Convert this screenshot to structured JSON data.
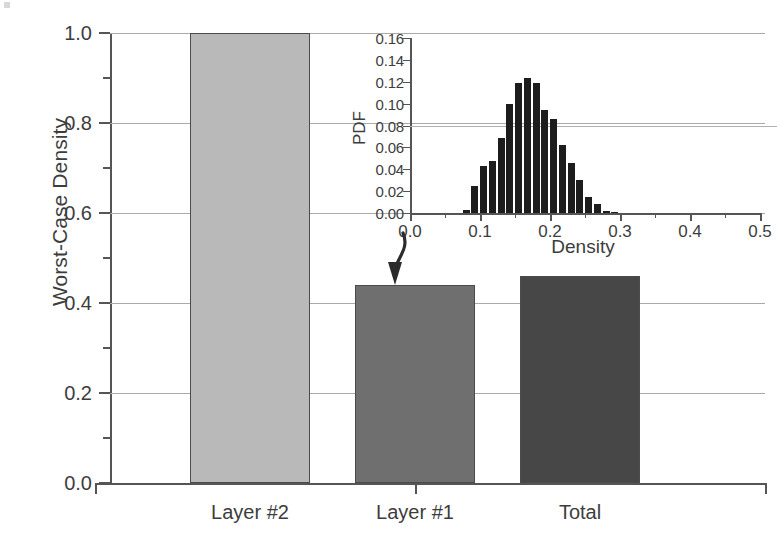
{
  "chart_data": {
    "type": "bar",
    "title": "",
    "xlabel": "",
    "ylabel": "Worst-Case Density",
    "categories": [
      "Layer #2",
      "Layer #1",
      "Total"
    ],
    "values": [
      1.0,
      0.44,
      0.46
    ],
    "ylim": [
      0.0,
      1.0
    ],
    "ytick_labels": [
      "0.0",
      "0.2",
      "0.4",
      "0.6",
      "0.8",
      "1.0"
    ],
    "ytick_values": [
      0.0,
      0.2,
      0.4,
      0.6,
      0.8,
      1.0
    ],
    "yminor_values": [
      0.1,
      0.3,
      0.5,
      0.7,
      0.9
    ],
    "grid": "horizontal",
    "legend": "none",
    "bar_colors": [
      "#b9b9b9",
      "#6f6f6f",
      "#474747"
    ],
    "bar_edge_color": "#4b4b4b",
    "annotation": {
      "type": "curved-arrow",
      "from": "inset-histogram",
      "to": "Layer #1 bar top"
    }
  },
  "inset_chart_data": {
    "type": "bar",
    "subtype": "histogram",
    "title": "",
    "xlabel": "Density",
    "ylabel": "PDF",
    "ylim": [
      0.0,
      0.16
    ],
    "xlim": [
      0.0,
      0.5
    ],
    "ytick_labels": [
      "0.00",
      "0.02",
      "0.04",
      "0.06",
      "0.08",
      "0.10",
      "0.12",
      "0.14",
      "0.16"
    ],
    "ytick_values": [
      0.0,
      0.02,
      0.04,
      0.06,
      0.08,
      0.1,
      0.12,
      0.14,
      0.16
    ],
    "xtick_labels": [
      "0.0",
      "0.1",
      "0.2",
      "0.3",
      "0.4",
      "0.5"
    ],
    "xtick_values": [
      0.0,
      0.1,
      0.2,
      0.3,
      0.4,
      0.5
    ],
    "grid": "horizontal",
    "bar_color": "#1d1d1d",
    "bin_width": 0.0125,
    "bin_centers": [
      0.06875,
      0.08125,
      0.09375,
      0.10625,
      0.11875,
      0.13125,
      0.14375,
      0.15625,
      0.16875,
      0.18125,
      0.19375,
      0.20625,
      0.21875,
      0.23125,
      0.24375,
      0.25625,
      0.26875,
      0.28125,
      0.29375,
      0.30625,
      0.31875,
      0.33125,
      0.34375,
      0.35625,
      0.36875,
      0.38125,
      0.39375
    ],
    "values": [
      0.0,
      0.003,
      0.025,
      0.043,
      0.048,
      0.069,
      0.1,
      0.119,
      0.123,
      0.119,
      0.094,
      0.086,
      0.062,
      0.046,
      0.03,
      0.015,
      0.008,
      0.002,
      0.001,
      0.0,
      0.0,
      0.0,
      0.0,
      0.0,
      0.0,
      0.0,
      0.0
    ]
  }
}
